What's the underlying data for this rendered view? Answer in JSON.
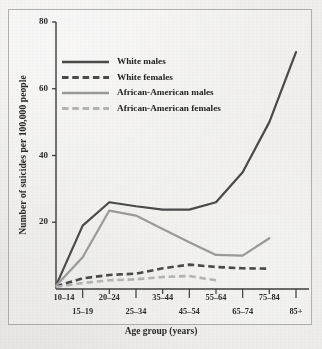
{
  "chart_data": {
    "type": "line",
    "title": "",
    "xlabel": "Age group (years)",
    "ylabel": "Number of suicides per 100,000 people",
    "categories": [
      "10–14",
      "15–19",
      "20–24",
      "25–34",
      "35–44",
      "45–54",
      "55–64",
      "65–74",
      "75–84",
      "85+"
    ],
    "yticks": [
      20,
      40,
      60,
      80
    ],
    "ylim": [
      0,
      80
    ],
    "grid": false,
    "legend_position": "upper-left",
    "series": [
      {
        "name": "White males",
        "style": "solid",
        "color": "#4a4a4a",
        "values": [
          1.0,
          19.0,
          26.0,
          24.8,
          23.8,
          23.8,
          26.0,
          35.0,
          50.0,
          71.0
        ]
      },
      {
        "name": "White females",
        "style": "dashed",
        "color": "#4a4a4a",
        "values": [
          0.8,
          3.2,
          4.2,
          4.6,
          6.2,
          7.3,
          6.6,
          6.2,
          6.1,
          null
        ]
      },
      {
        "name": "African-American males",
        "style": "solid",
        "color": "#9a9a9a",
        "values": [
          1.0,
          9.5,
          23.5,
          22.0,
          18.0,
          14.0,
          10.2,
          10.0,
          15.2,
          null
        ]
      },
      {
        "name": "African-American females",
        "style": "dashed",
        "color": "#b4b4b4",
        "values": [
          0.6,
          1.8,
          2.6,
          2.9,
          3.6,
          3.9,
          2.6,
          null,
          null,
          null
        ]
      }
    ]
  },
  "legend": {
    "items": [
      {
        "label": "White males"
      },
      {
        "label": "White females"
      },
      {
        "label": "African-American males"
      },
      {
        "label": "African-American females"
      }
    ]
  }
}
